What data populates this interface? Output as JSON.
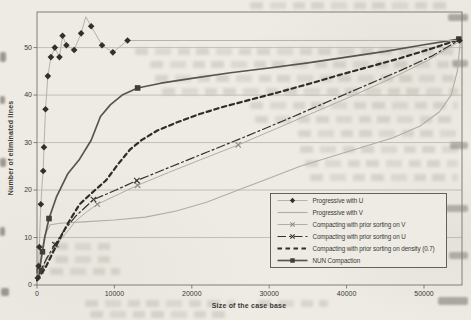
{
  "palette": {
    "paper": "#edebe4",
    "ink_dark": "#2e2d2b",
    "ink_medium": "#565551",
    "ink_light": "#b2aea2",
    "grid": "#a5a198",
    "frame": "#76736b",
    "text": "#3b3936"
  },
  "chart_data": {
    "type": "line",
    "title": "",
    "xlabel": "Size of the case base",
    "ylabel": "Number of eliminated lines",
    "xlim": [
      0,
      54900
    ],
    "ylim": [
      0,
      57.5
    ],
    "x_ticks": [
      0,
      10000,
      20000,
      30000,
      40000,
      50000
    ],
    "y_ticks": [
      0,
      10,
      20,
      30,
      40,
      50
    ],
    "grid": "horizontal-only",
    "legend_position": "lower-right-inside",
    "series": [
      {
        "id": "progressive_u",
        "name": "Progressive with U",
        "line_style": "solid",
        "line_color": "#b6b2a6",
        "line_width": 1,
        "marker": "diamond",
        "marker_color": "#31302c",
        "points": [
          [
            100,
            1.5
          ],
          [
            200,
            4
          ],
          [
            300,
            8
          ],
          [
            400,
            13
          ],
          [
            500,
            17
          ],
          [
            650,
            21
          ],
          [
            800,
            24
          ],
          [
            900,
            29
          ],
          [
            1100,
            37
          ],
          [
            1400,
            44
          ],
          [
            1800,
            48
          ],
          [
            2300,
            50
          ],
          [
            2900,
            48
          ],
          [
            3300,
            52.5
          ],
          [
            3800,
            50.5
          ],
          [
            4800,
            49.5
          ],
          [
            5700,
            53
          ],
          [
            6300,
            56.5
          ],
          [
            7000,
            54.5
          ],
          [
            8400,
            50.5
          ],
          [
            9800,
            49
          ],
          [
            11700,
            51.5
          ],
          [
            54600,
            51.5
          ]
        ],
        "marker_points": [
          [
            100,
            1.5
          ],
          [
            200,
            4
          ],
          [
            300,
            8
          ],
          [
            500,
            17
          ],
          [
            800,
            24
          ],
          [
            900,
            29
          ],
          [
            1100,
            37
          ],
          [
            1400,
            44
          ],
          [
            1800,
            48
          ],
          [
            2300,
            50
          ],
          [
            2900,
            48
          ],
          [
            3300,
            52.5
          ],
          [
            3800,
            50.5
          ],
          [
            4800,
            49.5
          ],
          [
            5700,
            53
          ],
          [
            7000,
            54.5
          ],
          [
            8400,
            50.5
          ],
          [
            9800,
            49
          ],
          [
            11700,
            51.5
          ],
          [
            54600,
            51.5
          ]
        ]
      },
      {
        "id": "progressive_v",
        "name": "Progressive with V",
        "line_style": "solid",
        "line_color": "#b1ada1",
        "line_width": 1.1,
        "marker": "none",
        "marker_color": "#b1ada1",
        "points": [
          [
            0,
            0.5
          ],
          [
            500,
            6
          ],
          [
            1000,
            10.5
          ],
          [
            1700,
            12.7
          ],
          [
            3000,
            13
          ],
          [
            6000,
            13.3
          ],
          [
            10000,
            13.7
          ],
          [
            14000,
            14.3
          ],
          [
            18000,
            15.6
          ],
          [
            22000,
            17.5
          ],
          [
            26000,
            20
          ],
          [
            30000,
            22.5
          ],
          [
            34000,
            25
          ],
          [
            38000,
            27
          ],
          [
            42000,
            29
          ],
          [
            46000,
            31
          ],
          [
            49500,
            33.5
          ],
          [
            52000,
            36.5
          ],
          [
            53500,
            40
          ],
          [
            54300,
            45
          ],
          [
            54700,
            51.3
          ]
        ],
        "marker_points": []
      },
      {
        "id": "sorting_v",
        "name": "Compacting with prior sorting on V",
        "line_style": "solid",
        "line_color": "#a9a69b",
        "line_width": 0.9,
        "marker": "x",
        "marker_color": "#8f8c82",
        "points": [
          [
            0,
            1
          ],
          [
            700,
            3.5
          ],
          [
            1500,
            6
          ],
          [
            2500,
            8.5
          ],
          [
            3800,
            11
          ],
          [
            5000,
            13.5
          ],
          [
            6500,
            15.5
          ],
          [
            7800,
            17
          ],
          [
            10000,
            18.7
          ],
          [
            13000,
            21
          ],
          [
            17000,
            23.7
          ],
          [
            21000,
            26.3
          ],
          [
            26000,
            29.5
          ],
          [
            31000,
            33
          ],
          [
            36000,
            36.5
          ],
          [
            41000,
            40
          ],
          [
            46000,
            43.7
          ],
          [
            50500,
            47.3
          ],
          [
            54500,
            51.2
          ]
        ],
        "marker_points": [
          [
            700,
            3.5
          ],
          [
            2500,
            8.5
          ],
          [
            7800,
            17
          ],
          [
            13000,
            21
          ],
          [
            26000,
            29.5
          ]
        ]
      },
      {
        "id": "sorting_u",
        "name": "Compacting with prior sorting on U",
        "line_style": "dashdot",
        "line_color": "#33322e",
        "line_width": 1.2,
        "marker": "x",
        "marker_color": "#33322e",
        "points": [
          [
            0,
            1.5
          ],
          [
            500,
            3
          ],
          [
            1200,
            5.5
          ],
          [
            2300,
            8.5
          ],
          [
            3500,
            11.5
          ],
          [
            5000,
            14.5
          ],
          [
            7300,
            18
          ],
          [
            10200,
            20
          ],
          [
            12900,
            22
          ],
          [
            17000,
            24.7
          ],
          [
            22000,
            28
          ],
          [
            27000,
            31.3
          ],
          [
            32000,
            34.7
          ],
          [
            37000,
            38.2
          ],
          [
            42000,
            41.7
          ],
          [
            47000,
            45.2
          ],
          [
            51000,
            48.2
          ],
          [
            54500,
            51.5
          ]
        ],
        "marker_points": [
          [
            500,
            3
          ],
          [
            2300,
            8.5
          ],
          [
            7300,
            18
          ],
          [
            12900,
            22
          ]
        ]
      },
      {
        "id": "density07",
        "name": "Compacting with prior sorting on density (0.7)",
        "line_style": "dashed",
        "line_color": "#2e2d2b",
        "line_width": 2.2,
        "marker": "none",
        "marker_color": "#2e2d2b",
        "points": [
          [
            0,
            1
          ],
          [
            1200,
            4
          ],
          [
            2700,
            9
          ],
          [
            4000,
            13
          ],
          [
            5500,
            17
          ],
          [
            7500,
            20
          ],
          [
            8900,
            22
          ],
          [
            10500,
            25.5
          ],
          [
            12000,
            28.5
          ],
          [
            13500,
            30.5
          ],
          [
            15500,
            32.5
          ],
          [
            18000,
            34.2
          ],
          [
            21000,
            36
          ],
          [
            24000,
            37.5
          ],
          [
            27500,
            39
          ],
          [
            31000,
            40.5
          ],
          [
            35000,
            42.3
          ],
          [
            39000,
            44.2
          ],
          [
            43000,
            46
          ],
          [
            47000,
            47.8
          ],
          [
            51000,
            49.8
          ],
          [
            54500,
            51.7
          ]
        ],
        "marker_points": []
      },
      {
        "id": "nun",
        "name": "NUN Compaction",
        "line_style": "solid",
        "line_color": "#565551",
        "line_width": 1.7,
        "marker": "square",
        "marker_color": "#3f3e3a",
        "points": [
          [
            0,
            1.5
          ],
          [
            300,
            3
          ],
          [
            700,
            7
          ],
          [
            1000,
            10
          ],
          [
            1550,
            14
          ],
          [
            2500,
            18.5
          ],
          [
            4000,
            23.5
          ],
          [
            5500,
            26.5
          ],
          [
            7000,
            30.5
          ],
          [
            8200,
            35.5
          ],
          [
            9500,
            38
          ],
          [
            11000,
            40
          ],
          [
            13000,
            41.5
          ],
          [
            16000,
            42.5
          ],
          [
            20000,
            43.5
          ],
          [
            25000,
            44.7
          ],
          [
            30000,
            45.7
          ],
          [
            35000,
            46.8
          ],
          [
            40000,
            48
          ],
          [
            45000,
            49.2
          ],
          [
            50000,
            50.6
          ],
          [
            54500,
            51.8
          ]
        ],
        "marker_points": [
          [
            300,
            3
          ],
          [
            700,
            7
          ],
          [
            1550,
            14
          ],
          [
            13000,
            41.5
          ],
          [
            54500,
            51.8
          ]
        ]
      }
    ]
  }
}
